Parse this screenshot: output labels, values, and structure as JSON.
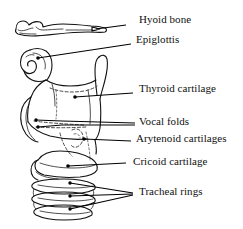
{
  "figure": {
    "kind": "anatomical-line-drawing",
    "background_color": "#ffffff",
    "ink_color": "#111111",
    "width": 243,
    "height": 229
  },
  "labels": [
    {
      "id": "hyoid-bone",
      "text": "Hyoid bone",
      "x": 139,
      "y": 19,
      "leader": {
        "type": "single",
        "from_x": 126,
        "from_y": 25,
        "to_x": 96,
        "to_y": 29
      }
    },
    {
      "id": "epiglottis",
      "text": "Epiglottis",
      "x": 136,
      "y": 38,
      "leader": {
        "type": "single",
        "from_x": 131,
        "from_y": 44,
        "to_x": 38,
        "to_y": 58
      }
    },
    {
      "id": "thyroid-cartilage",
      "text": "Thyroid cartilage",
      "x": 139,
      "y": 87,
      "leader": {
        "type": "single",
        "from_x": 133,
        "from_y": 93,
        "to_x": 75,
        "to_y": 97
      }
    },
    {
      "id": "vocal-folds",
      "text": "Vocal folds",
      "x": 139,
      "y": 119,
      "leader": {
        "type": "double",
        "from_x": 135,
        "from_y": 124,
        "to_x": 36,
        "to_y": 122
      }
    },
    {
      "id": "arytenoid-cartilages",
      "text": "Arytenoid cartilages",
      "x": 136,
      "y": 136,
      "leader": {
        "type": "single",
        "from_x": 131,
        "from_y": 142,
        "to_x": 84,
        "to_y": 139
      }
    },
    {
      "id": "cricoid-cartilage",
      "text": "Cricoid cartilage",
      "x": 139,
      "y": 158,
      "leader": {
        "type": "single",
        "from_x": 126,
        "from_y": 164,
        "to_x": 68,
        "to_y": 166
      }
    },
    {
      "id": "tracheal-rings",
      "text": "Tracheal rings",
      "x": 139,
      "y": 188,
      "leader": {
        "type": "triple",
        "from_x": 133,
        "from_y": 194,
        "to_x": 63,
        "to_y": 182
      }
    }
  ]
}
